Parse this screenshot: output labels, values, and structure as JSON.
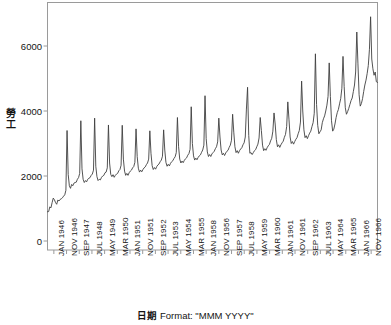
{
  "chart_data": {
    "type": "line",
    "title": "",
    "subtitle": "",
    "xlabel": "日期 Format: \"MMM YYYY\"",
    "xlabel_cjk": "日期",
    "xlabel_latin": " Format: \"MMM YYYY\"",
    "ylabel": "勞工",
    "ylabel_chars": [
      "勞",
      "工"
    ],
    "grid": false,
    "legend": null,
    "ylim": [
      0,
      7000
    ],
    "yticks": [
      0,
      2000,
      4000,
      6000
    ],
    "ytick_labels": [
      "0",
      "2000",
      "4000",
      "6000"
    ],
    "xtick_labels": [
      "JAN 1946",
      "NOV 1946",
      "SEP 1947",
      "JUL 1948",
      "MAY 1949",
      "MAR 1950",
      "JAN 1951",
      "NOV 1951",
      "SEP 1952",
      "JUL 1953",
      "MAY 1954",
      "MAR 1955",
      "JAN 1958",
      "NOV 1956",
      "SEP 1957",
      "JUL 1958",
      "MAY 1959",
      "MAR 1960",
      "JAN 1961",
      "NOV 1961",
      "SEP 1962",
      "JUL 1963",
      "MAY 1964",
      "MAR 1965",
      "JAN 1966",
      "NOV 1966"
    ],
    "series_name": "勞工",
    "line_color": "#404040",
    "x_index_start": 1,
    "x_index_count": 252,
    "values": [
      900,
      905,
      1050,
      1020,
      1180,
      1320,
      1270,
      1180,
      1130,
      1260,
      1230,
      1280,
      1300,
      1330,
      1380,
      1420,
      1560,
      3400,
      2050,
      1700,
      1620,
      1740,
      1700,
      1780,
      1800,
      1810,
      1900,
      1950,
      2080,
      3700,
      2220,
      1900,
      1800,
      1860,
      1820,
      1900,
      1930,
      1950,
      2020,
      2060,
      2180,
      3780,
      2300,
      1980,
      1860,
      1900,
      1880,
      1960,
      2000,
      2020,
      2100,
      2120,
      2250,
      3570,
      2400,
      2050,
      1980,
      2040,
      1960,
      2020,
      2060,
      2080,
      2160,
      2200,
      2330,
      3560,
      2520,
      2150,
      2020,
      2080,
      2020,
      2100,
      2150,
      2180,
      2250,
      2290,
      2420,
      3450,
      2600,
      2240,
      2120,
      2180,
      2130,
      2200,
      2250,
      2280,
      2350,
      2400,
      2520,
      3390,
      2700,
      2320,
      2200,
      2260,
      2210,
      2290,
      2340,
      2370,
      2440,
      2490,
      2610,
      3420,
      2800,
      2420,
      2300,
      2360,
      2310,
      2390,
      2440,
      2470,
      2540,
      2590,
      2720,
      3800,
      2900,
      2520,
      2400,
      2460,
      2410,
      2480,
      2530,
      2560,
      2640,
      2690,
      2820,
      4130,
      3000,
      2620,
      2490,
      2550,
      2500,
      2570,
      2620,
      2650,
      2730,
      2800,
      2950,
      4470,
      3150,
      2740,
      2600,
      2660,
      2600,
      2680,
      2720,
      2760,
      2840,
      2900,
      3050,
      3780,
      3200,
      2800,
      2650,
      2700,
      2630,
      2710,
      2760,
      2790,
      2880,
      2950,
      3100,
      3900,
      3350,
      2900,
      2720,
      2780,
      2700,
      2780,
      2830,
      2870,
      2960,
      3020,
      3200,
      4060,
      4730,
      3250,
      2700,
      2720,
      2660,
      2720,
      2780,
      2810,
      2900,
      2980,
      3170,
      3800,
      3400,
      2950,
      2780,
      2840,
      2790,
      2870,
      2930,
      2970,
      3080,
      3160,
      3380,
      3940,
      3600,
      3120,
      2900,
      2960,
      2880,
      2960,
      3020,
      3070,
      3190,
      3280,
      3520,
      4280,
      3750,
      3200,
      3000,
      3060,
      2980,
      3060,
      3130,
      3180,
      3300,
      3400,
      3660,
      4920,
      4000,
      3420,
      3180,
      3240,
      3150,
      3240,
      3320,
      3380,
      3520,
      3640,
      3930,
      5760,
      4200,
      3560,
      3300,
      3360,
      3420,
      3640,
      3760,
      3850,
      4000,
      4180,
      4450,
      5480,
      4450,
      3700,
      3380,
      3440,
      3600,
      3800,
      3950,
      4050,
      4220,
      4380,
      4700,
      5680,
      4750,
      4100,
      3900,
      3980,
      4080,
      4200,
      4320,
      4400,
      4600,
      4800,
      5200,
      6430,
      5450,
      4500,
      4150,
      4230,
      4380,
      4600,
      4800,
      4950,
      5150,
      5400,
      5900,
      6900,
      5600,
      5300,
      5100,
      5200,
      4900,
      4880
    ]
  }
}
